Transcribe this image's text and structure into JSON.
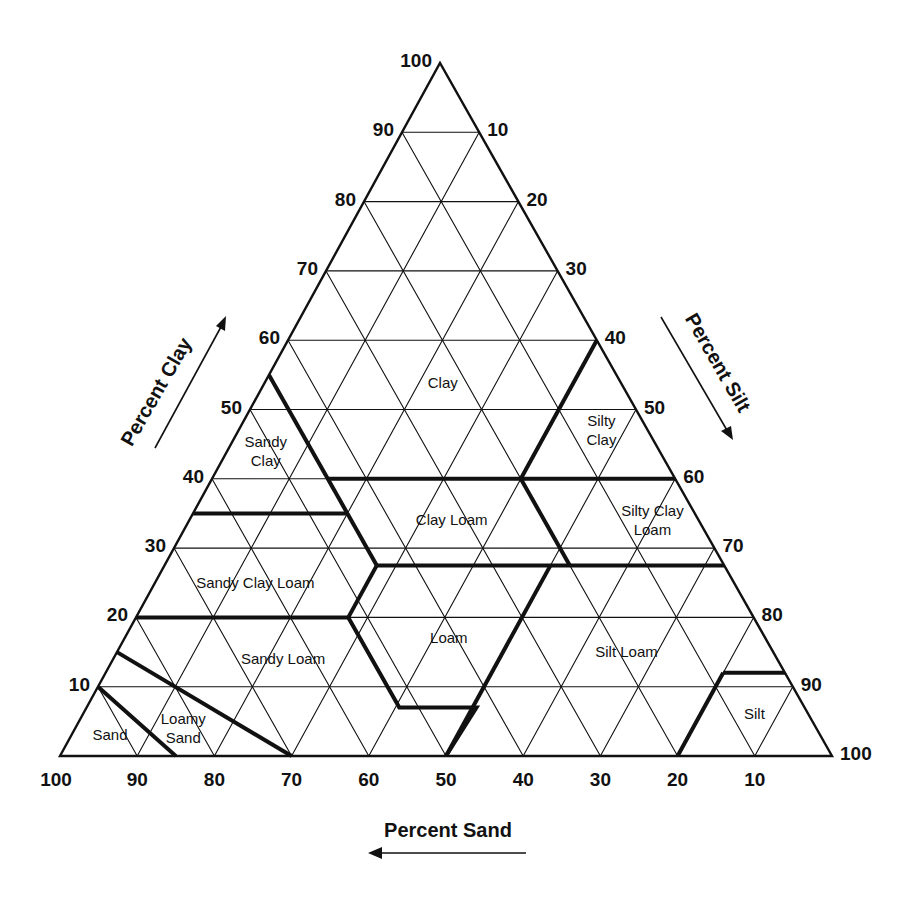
{
  "chart_data": {
    "type": "ternary",
    "title": "",
    "geometry": {
      "bottom_left": [
        60,
        756
      ],
      "bottom_right": [
        832,
        756
      ],
      "apex": [
        440,
        63
      ],
      "corners": {
        "bottom_left": "100% sand",
        "bottom_right": "100% silt",
        "apex": "100% clay"
      }
    },
    "axes": {
      "clay": {
        "label": "Percent Clay",
        "ticks": [
          10,
          20,
          30,
          40,
          50,
          60,
          70,
          80,
          90,
          100
        ],
        "side": "left",
        "arrow": "up"
      },
      "silt": {
        "label": "Percent Silt",
        "ticks": [
          10,
          20,
          30,
          40,
          50,
          60,
          70,
          80,
          90,
          100
        ],
        "side": "right",
        "arrow": "down"
      },
      "sand": {
        "label": "Percent Sand",
        "ticks": [
          100,
          90,
          80,
          70,
          60,
          50,
          40,
          30,
          20,
          10
        ],
        "side": "bottom",
        "arrow": "left"
      }
    },
    "grid": {
      "on": true,
      "step": 10
    },
    "colors": {
      "line": "#111111",
      "background": "#ffffff"
    },
    "regions": [
      {
        "name": "Clay",
        "lines": [
          "Clay"
        ],
        "label_at": {
          "sand": 30,
          "silt": 30,
          "clay": 70
        }
      },
      {
        "name": "Sandy Clay",
        "lines": [
          "Sandy",
          "Clay"
        ],
        "label_at": {
          "sand": 51,
          "silt": 5,
          "clay": 44
        }
      },
      {
        "name": "Silty Clay",
        "lines": [
          "Silty",
          "Clay"
        ],
        "label_at": {
          "sand": 6,
          "silt": 47,
          "clay": 47
        }
      },
      {
        "name": "Clay Loam",
        "lines": [
          "Clay Loam"
        ],
        "label_at": {
          "sand": 32,
          "silt": 34,
          "clay": 34
        }
      },
      {
        "name": "Silty Clay Loam",
        "lines": [
          "Silty Clay",
          "Loam"
        ],
        "label_at": {
          "sand": 6,
          "silt": 60,
          "clay": 34
        }
      },
      {
        "name": "Sandy Clay Loam",
        "lines": [
          "Sandy Clay Loam"
        ],
        "label_at": {
          "sand": 62,
          "silt": 13,
          "clay": 25
        }
      },
      {
        "name": "Loam",
        "lines": [
          "Loam"
        ],
        "label_at": {
          "sand": 41,
          "silt": 42,
          "clay": 17
        }
      },
      {
        "name": "Silt Loam",
        "lines": [
          "Silt Loam"
        ],
        "label_at": {
          "sand": 19,
          "silt": 66,
          "clay": 15
        }
      },
      {
        "name": "Sandy Loam",
        "lines": [
          "Sandy Loam"
        ],
        "label_at": {
          "sand": 64,
          "silt": 22,
          "clay": 14
        }
      },
      {
        "name": "Loamy Sand",
        "lines": [
          "Loamy",
          "Sand"
        ],
        "label_at": {
          "sand": 82,
          "silt": 14,
          "clay": 4
        }
      },
      {
        "name": "Sand",
        "lines": [
          "Sand"
        ],
        "label_at": {
          "sand": 92,
          "silt": 5,
          "clay": 3
        }
      },
      {
        "name": "Silt",
        "lines": [
          "Silt"
        ],
        "label_at": {
          "sand": 7,
          "silt": 87,
          "clay": 6
        }
      }
    ],
    "boundaries": [
      {
        "name": "sand-loamysand",
        "points": [
          [
            90,
            10,
            0
          ],
          [
            85,
            15,
            0
          ]
        ]
      },
      {
        "name": "sand-loamysand-upper",
        "points": [
          [
            90,
            0,
            10
          ],
          [
            85,
            15,
            0
          ]
        ]
      },
      {
        "name": "loamysand-sandyloam",
        "points": [
          [
            85,
            0,
            15
          ],
          [
            70,
            30,
            0
          ]
        ]
      },
      {
        "name": "sandyloam-top",
        "points": [
          [
            80,
            0,
            20
          ],
          [
            52.5,
            27.5,
            20
          ]
        ]
      },
      {
        "name": "sandyloam-loam-a",
        "points": [
          [
            52.5,
            27.5,
            20
          ],
          [
            52.5,
            40.5,
            7
          ]
        ]
      },
      {
        "name": "loam-bottom",
        "points": [
          [
            52.5,
            40.5,
            7
          ],
          [
            42.5,
            50.5,
            7
          ]
        ]
      },
      {
        "name": "loam-siltloam",
        "points": [
          [
            42.5,
            50.5,
            7
          ],
          [
            50,
            50,
            0
          ]
        ]
      },
      {
        "name": "sandyclayloam-loam",
        "points": [
          [
            52.5,
            27.5,
            20
          ],
          [
            45,
            27.5,
            27.5
          ]
        ]
      },
      {
        "name": "clayloam-bottom",
        "points": [
          [
            45,
            27.5,
            27.5
          ],
          [
            0,
            72.5,
            27.5
          ]
        ]
      },
      {
        "name": "loam-siltloam-upper",
        "points": [
          [
            22.5,
            50,
            27.5
          ],
          [
            50,
            50,
            0
          ]
        ]
      },
      {
        "name": "sandyclayloam-top",
        "points": [
          [
            65,
            0,
            35
          ],
          [
            45,
            20,
            35
          ]
        ]
      },
      {
        "name": "sandyclay-right",
        "points": [
          [
            45,
            0,
            55
          ],
          [
            45,
            27.5,
            27.5
          ]
        ]
      },
      {
        "name": "clay-bottom",
        "points": [
          [
            45,
            15,
            40
          ],
          [
            20,
            40,
            40
          ]
        ]
      },
      {
        "name": "siltyclay-bottom",
        "points": [
          [
            20,
            40,
            40
          ],
          [
            0,
            60,
            40
          ]
        ]
      },
      {
        "name": "siltyclay-left",
        "points": [
          [
            0,
            40,
            60
          ],
          [
            20,
            40,
            40
          ]
        ]
      },
      {
        "name": "siltyclayloam-left",
        "points": [
          [
            20,
            40,
            40
          ],
          [
            0,
            72.5,
            27.5
          ]
        ]
      },
      {
        "name": "siltloam-silt",
        "points": [
          [
            20,
            80,
            0
          ],
          [
            8,
            80,
            12
          ]
        ]
      },
      {
        "name": "silt-top",
        "points": [
          [
            8,
            80,
            12
          ],
          [
            0,
            88,
            12
          ]
        ]
      },
      {
        "name": "siltyclayloam-siltloam-fix",
        "points": [
          [
            20,
            52.5,
            27.5
          ],
          [
            20,
            52.5,
            27.5
          ]
        ]
      }
    ]
  }
}
